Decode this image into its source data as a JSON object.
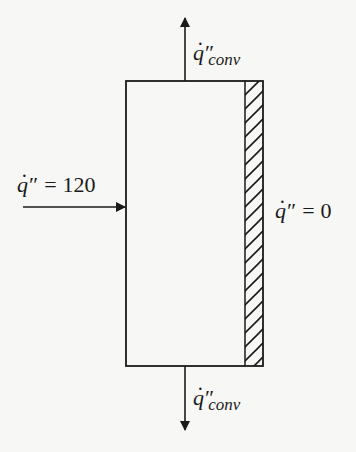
{
  "diagram": {
    "type": "heat-flux-slab",
    "colors": {
      "background": "#f7f7f5",
      "stroke": "#1a1a1a"
    },
    "slab": {
      "x": 126,
      "y": 81,
      "width": 137,
      "height": 285,
      "insulated_inner_x": 245,
      "hatch": "diagonal"
    },
    "labels": {
      "top_flux": {
        "symbol": "q",
        "prime": "″",
        "subscript": "conv"
      },
      "bottom_flux": {
        "symbol": "q",
        "prime": "″",
        "subscript": "conv"
      },
      "left_flux": {
        "symbol": "q",
        "prime": "″",
        "equals": "=",
        "value": "120"
      },
      "right_flux": {
        "symbol": "q",
        "prime": "″",
        "equals": "=",
        "value": "0"
      }
    },
    "arrows": [
      {
        "name": "top-convection-arrow",
        "direction": "up",
        "from": [
          185,
          81
        ],
        "to": [
          185,
          17
        ]
      },
      {
        "name": "bottom-convection-arrow",
        "direction": "down",
        "from": [
          185,
          366
        ],
        "to": [
          185,
          431
        ]
      },
      {
        "name": "left-input-arrow",
        "direction": "right",
        "from": [
          23,
          207
        ],
        "to": [
          126,
          207
        ]
      }
    ]
  }
}
